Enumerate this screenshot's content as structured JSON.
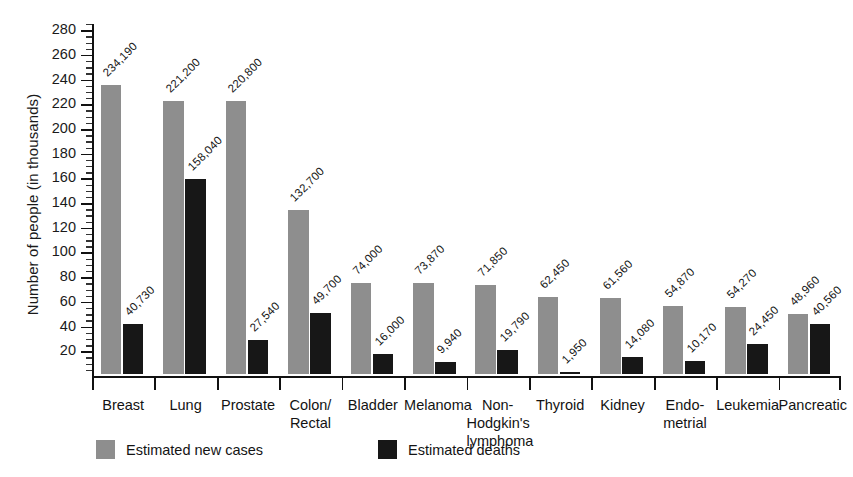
{
  "chart_data": {
    "type": "bar",
    "title": "",
    "xlabel": "",
    "ylabel": "Number of people (in thousands)",
    "ylim": [
      0,
      285
    ],
    "ytick_step": 20,
    "yticks": [
      20,
      40,
      60,
      80,
      100,
      120,
      140,
      160,
      180,
      200,
      220,
      240,
      260,
      280
    ],
    "ytick_labels": [
      "20",
      "40",
      "60",
      "80",
      "100",
      "120",
      "140",
      "160",
      "180",
      "200",
      "220",
      "240",
      "260",
      "280"
    ],
    "minor_tick_step": 5,
    "grid": false,
    "legend_position": "bottom-left",
    "units_note": "values plotted in thousands; data labels show absolute counts",
    "categories": [
      "Breast",
      "Lung",
      "Prostate",
      "Colon/\nRectal",
      "Bladder",
      "Melanoma",
      "Non-\nHodgkin's\nlymphoma",
      "Thyroid",
      "Kidney",
      "Endo-\nmetrial",
      "Leukemia",
      "Pancreatic"
    ],
    "category_lines": [
      [
        "Breast"
      ],
      [
        "Lung"
      ],
      [
        "Prostate"
      ],
      [
        "Colon/",
        "Rectal"
      ],
      [
        "Bladder"
      ],
      [
        "Melanoma"
      ],
      [
        "Non-",
        "Hodgkin's",
        "lymphoma"
      ],
      [
        "Thyroid"
      ],
      [
        "Kidney"
      ],
      [
        "Endo-",
        "metrial"
      ],
      [
        "Leukemia"
      ],
      [
        "Pancreatic"
      ]
    ],
    "series": [
      {
        "name": "Estimated new cases",
        "color": "#8e8e8e",
        "values": [
          234.19,
          221.2,
          220.8,
          132.7,
          74.0,
          73.87,
          71.85,
          62.45,
          61.56,
          54.87,
          54.27,
          48.96
        ],
        "labels": [
          "234,190",
          "221,200",
          "220,800",
          "132,700",
          "74,000",
          "73,870",
          "71,850",
          "62,450",
          "61,560",
          "54,870",
          "54,270",
          "48,960"
        ]
      },
      {
        "name": "Estimated deaths",
        "color": "#171717",
        "values": [
          40.73,
          158.04,
          27.54,
          49.7,
          16.0,
          9.94,
          19.79,
          1.95,
          14.08,
          10.17,
          24.45,
          40.56
        ],
        "labels": [
          "40,730",
          "158,040",
          "27,540",
          "49,700",
          "16,000",
          "9,940",
          "19,790",
          "1,950",
          "14,080",
          "10,170",
          "24,450",
          "40,560"
        ]
      }
    ]
  },
  "legend": {
    "items": [
      {
        "label": "Estimated new cases",
        "swatch": "cases"
      },
      {
        "label": "Estimated deaths",
        "swatch": "deaths"
      }
    ]
  },
  "axis": {
    "y_title": "Number of people (in thousands)"
  }
}
